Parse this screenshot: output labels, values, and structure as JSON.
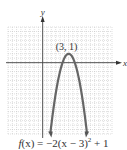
{
  "chart_data": {
    "type": "line",
    "title": "",
    "function": "f(x) = -2(x - 3)^2 + 1",
    "caption": "f(x) = −2(x − 3)² + 1",
    "xlabel": "x",
    "ylabel": "y",
    "xlim": [
      -4,
      8
    ],
    "ylim": [
      -8,
      4
    ],
    "grid": true,
    "legend": "none",
    "annotations": [
      {
        "text": "(3, 1)",
        "x": 3,
        "y": 1
      }
    ],
    "series": [
      {
        "name": "f(x) = -2(x - 3)^2 + 1",
        "x": [
          0.9,
          1,
          1.5,
          2,
          2.5,
          3,
          3.5,
          4,
          4.5,
          5,
          5.1
        ],
        "y": [
          -7.82,
          -7,
          -3.5,
          -1,
          0.5,
          1,
          0.5,
          -1,
          -3.5,
          -7,
          -7.82
        ]
      }
    ],
    "vertex": {
      "x": 3,
      "y": 1,
      "label": "(3, 1)"
    },
    "color": "#666666"
  },
  "labels": {
    "y_axis": "y",
    "x_axis": "x",
    "vertex": "(3, 1)",
    "caption_prefix": "f",
    "caption_body": "(x) = −2(x − 3)",
    "caption_exp": "2",
    "caption_tail": " + 1"
  }
}
